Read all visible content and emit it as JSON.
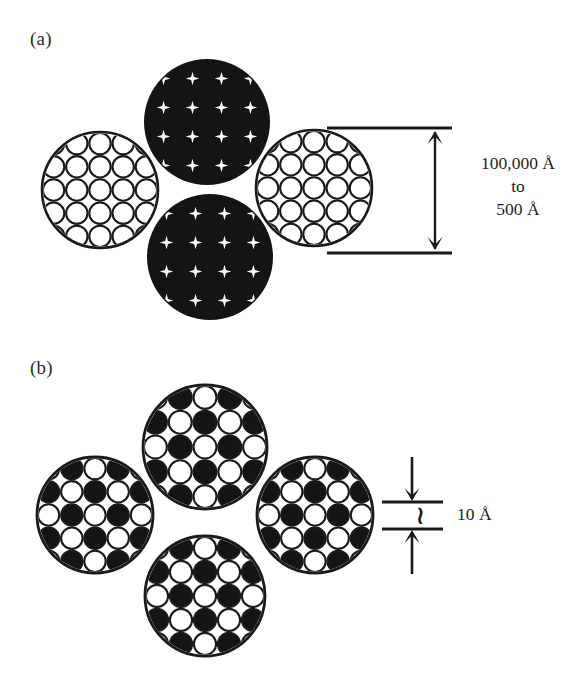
{
  "figure": {
    "background_color": "#ffffff",
    "ink_color": "#1a1a1a",
    "fill_black": "#141414"
  },
  "panels": [
    {
      "id": "a",
      "label": "(a)",
      "description": "Four touching large circles: two outlined (white) showing packed open circles and two solid black showing star-shaped interstitial voids",
      "circles": [
        {
          "role": "outline",
          "cx": 100,
          "cy": 190,
          "r": 58
        },
        {
          "role": "solid",
          "cx": 207,
          "cy": 122,
          "r": 63
        },
        {
          "role": "outline",
          "cx": 314,
          "cy": 188,
          "r": 58
        },
        {
          "role": "solid",
          "cx": 210,
          "cy": 257,
          "r": 63
        }
      ],
      "annotation": {
        "type": "vertical-dimension",
        "lines": [
          "100,000 Å",
          "to",
          "500 Å"
        ],
        "top_y": 128,
        "bottom_y": 253,
        "arrow_x": 435,
        "tick_x1": 327,
        "tick_x2": 452
      }
    },
    {
      "id": "b",
      "label": "(b)",
      "description": "Four touching large circles each filled with a checkerboard of alternating solid-black and open circles",
      "circles": [
        {
          "role": "checker",
          "cx": 95,
          "cy": 515,
          "r": 58
        },
        {
          "role": "checker",
          "cx": 205,
          "cy": 447,
          "r": 62
        },
        {
          "role": "checker",
          "cx": 315,
          "cy": 515,
          "r": 58
        },
        {
          "role": "checker",
          "cx": 205,
          "cy": 596,
          "r": 60
        }
      ],
      "annotation": {
        "type": "vertical-dimension-small",
        "label": "10 Å",
        "approx_symbol": "∼",
        "top_y": 502,
        "bottom_y": 529,
        "arrow_x": 412,
        "tick_x1": 382,
        "tick_x2": 443
      }
    }
  ],
  "icons": {
    "arrow_down": "arrow-down-icon",
    "arrow_up": "arrow-up-icon",
    "tilde": "approximately-equal-icon"
  }
}
